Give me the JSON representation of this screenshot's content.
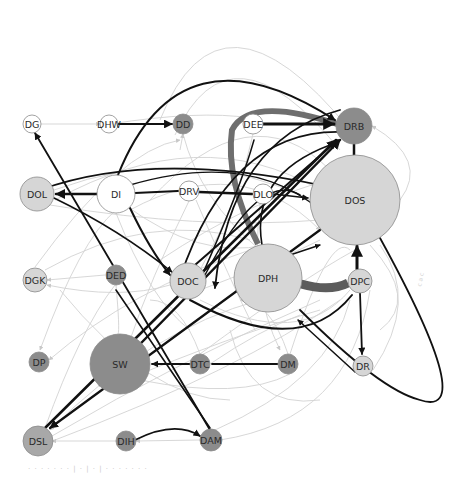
{
  "diagram": {
    "type": "directed-network-graph",
    "colors": {
      "node_white": "#ffffff",
      "node_light": "#d6d6d6",
      "node_dark": "#8c8c8c",
      "node_stroke": "#8a8a8a",
      "edge_strong": "#111111",
      "edge_medium": "#666666",
      "edge_weak": "#cfcfcf"
    },
    "nodes": [
      {
        "id": "DG",
        "label": "DG",
        "x": 32,
        "y": 124,
        "r": 9,
        "shade": "white"
      },
      {
        "id": "DHW",
        "label": "DHW",
        "x": 109,
        "y": 124,
        "r": 9,
        "shade": "white"
      },
      {
        "id": "DD",
        "label": "DD",
        "x": 183,
        "y": 124,
        "r": 10,
        "shade": "dark"
      },
      {
        "id": "DEE",
        "label": "DEE",
        "x": 253,
        "y": 124,
        "r": 10,
        "shade": "white"
      },
      {
        "id": "DRB",
        "label": "DRB",
        "x": 354,
        "y": 126,
        "r": 18,
        "shade": "dark"
      },
      {
        "id": "DOL",
        "label": "DOL",
        "x": 37,
        "y": 194,
        "r": 17,
        "shade": "light"
      },
      {
        "id": "DI",
        "label": "DI",
        "x": 116,
        "y": 194,
        "r": 19,
        "shade": "white"
      },
      {
        "id": "DRV",
        "label": "DRV",
        "x": 189,
        "y": 191,
        "r": 10,
        "shade": "white"
      },
      {
        "id": "DLO",
        "label": "DLO",
        "x": 263,
        "y": 194,
        "r": 10,
        "shade": "white"
      },
      {
        "id": "DOS",
        "label": "DOS",
        "x": 355,
        "y": 200,
        "r": 45,
        "shade": "light"
      },
      {
        "id": "DGK",
        "label": "DGK",
        "x": 35,
        "y": 280,
        "r": 12,
        "shade": "light"
      },
      {
        "id": "DED",
        "label": "DED",
        "x": 116,
        "y": 275,
        "r": 10,
        "shade": "dark"
      },
      {
        "id": "DOC",
        "label": "DOC",
        "x": 188,
        "y": 281,
        "r": 18,
        "shade": "light"
      },
      {
        "id": "DPH",
        "label": "DPH",
        "x": 268,
        "y": 278,
        "r": 34,
        "shade": "light"
      },
      {
        "id": "DPC",
        "label": "DPC",
        "x": 360,
        "y": 281,
        "r": 12,
        "shade": "light"
      },
      {
        "id": "DP",
        "label": "DP",
        "x": 39,
        "y": 362,
        "r": 10,
        "shade": "dark"
      },
      {
        "id": "SW",
        "label": "SW",
        "x": 120,
        "y": 364,
        "r": 30,
        "shade": "dark"
      },
      {
        "id": "DTC",
        "label": "DTC",
        "x": 200,
        "y": 364,
        "r": 10,
        "shade": "dark"
      },
      {
        "id": "DM",
        "label": "DM",
        "x": 288,
        "y": 364,
        "r": 10,
        "shade": "dark"
      },
      {
        "id": "DR",
        "label": "DR",
        "x": 363,
        "y": 366,
        "r": 10,
        "shade": "light"
      },
      {
        "id": "DSL",
        "label": "DSL",
        "x": 38,
        "y": 441,
        "r": 15,
        "shade": "light_dark"
      },
      {
        "id": "DIH",
        "label": "DIH",
        "x": 126,
        "y": 441,
        "r": 10,
        "shade": "dark"
      },
      {
        "id": "DAM",
        "label": "DAM",
        "x": 211,
        "y": 440,
        "r": 11,
        "shade": "dark"
      }
    ],
    "strong_edges": [
      {
        "from": "DHW",
        "to": "DD",
        "w": 2.2,
        "curve": 0
      },
      {
        "from": "DEE",
        "to": "DRB",
        "w": 3,
        "curve": 0
      },
      {
        "from": "DI",
        "to": "DOL",
        "w": 2.5,
        "curve": 0
      },
      {
        "from": "DI",
        "to": "DRV",
        "w": 2,
        "curve": 0
      },
      {
        "from": "DRV",
        "to": "DLO",
        "w": 2.5,
        "curve": 0
      },
      {
        "from": "DLO",
        "to": "DOS",
        "w": 1.6,
        "curve": 0
      },
      {
        "from": "DTC",
        "to": "SW",
        "w": 1.8,
        "curve": 0
      },
      {
        "from": "DM",
        "to": "DTC",
        "w": 1.8,
        "curve": 0
      },
      {
        "from": "DPC",
        "to": "DR",
        "w": 1.8,
        "curve": 0
      },
      {
        "from": "DR",
        "to": "DPH",
        "w": 1.5,
        "curve": 0
      },
      {
        "from": "DAM",
        "to": "DG",
        "w": 1.8,
        "curve": 0
      },
      {
        "from": "SW",
        "to": "DRB",
        "w": 2.5,
        "curve": 0
      },
      {
        "from": "DSL",
        "to": "DRB",
        "w": 2.5,
        "curve": 0
      },
      {
        "from": "DOS",
        "to": "DSL",
        "w": 2.2,
        "curve": 0
      },
      {
        "from": "DOC",
        "to": "DRB",
        "w": 2,
        "curve": 0
      },
      {
        "from": "DIH",
        "to": "DAM",
        "w": 1.8,
        "curve": -30
      },
      {
        "from": "DPC",
        "to": "DOS",
        "w": 3,
        "curve": 0
      },
      {
        "from": "DOS",
        "to": "DRB",
        "w": 2.5,
        "curve": 0
      },
      {
        "from": "DI",
        "to": "DOC",
        "w": 2,
        "curve": 0
      },
      {
        "from": "DOL",
        "to": "DOC",
        "w": 1.6,
        "curve": 0
      }
    ],
    "highlight_edges": [
      {
        "from": "DRB",
        "to": "DPH",
        "w": 6,
        "shade": "medium"
      },
      {
        "from": "DPH",
        "to": "DPC",
        "w": 8,
        "shade": "medium"
      }
    ],
    "caption": "· · · · ·  · · | · | · | · · ·  · · · ·",
    "side_note": "c a c"
  }
}
